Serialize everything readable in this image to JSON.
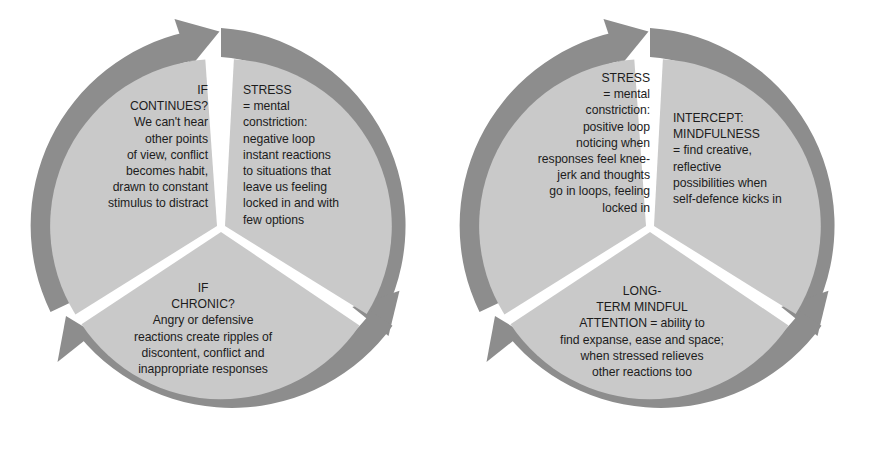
{
  "diagram": {
    "colors": {
      "arrow_ring": "#8d8d8d",
      "wedge_fill": "#c9c9c9",
      "text": "#1c1c1c",
      "background": "#ffffff",
      "gap": "#ffffff"
    },
    "cycles": [
      {
        "id": "stress-cycle",
        "name": "Stress negative loop",
        "direction": "clockwise",
        "segments": [
          {
            "id": "stress-top-right",
            "position": "top-right",
            "align": "left",
            "text": "STRESS\n= mental\nconstriction:\nnegative loop\ninstant reactions\nto situations that\nleave us feeling\nlocked in and with\nfew options"
          },
          {
            "id": "stress-bottom",
            "position": "bottom",
            "align": "center",
            "text": "IF\nCHRONIC?\nAngry or defensive\nreactions create ripples of\ndiscontent, conflict and\ninappropriate responses"
          },
          {
            "id": "stress-top-left",
            "position": "top-left",
            "align": "right",
            "text": "IF\nCONTINUES?\nWe can't hear\nother points\nof view, conflict\nbecomes habit,\ndrawn to constant\nstimulus to distract"
          }
        ]
      },
      {
        "id": "mindfulness-cycle",
        "name": "Mindfulness positive loop",
        "direction": "clockwise",
        "segments": [
          {
            "id": "mindful-top-right",
            "position": "top-right",
            "align": "left",
            "text": "INTERCEPT:\nMINDFULNESS\n= find creative,\nreflective\npossibilities when\nself-defence kicks in"
          },
          {
            "id": "mindful-bottom",
            "position": "bottom",
            "align": "center",
            "text": "LONG-\nTERM MINDFUL\nATTENTION = ability to\nfind expanse, ease and space;\nwhen stressed relieves\nother reactions too"
          },
          {
            "id": "mindful-top-left",
            "position": "top-left",
            "align": "right",
            "text": "STRESS\n= mental\nconstriction:\npositive loop\nnoticing when\nresponses feel knee-\njerk and thoughts\ngo in loops, feeling\nlocked in"
          }
        ]
      }
    ]
  }
}
